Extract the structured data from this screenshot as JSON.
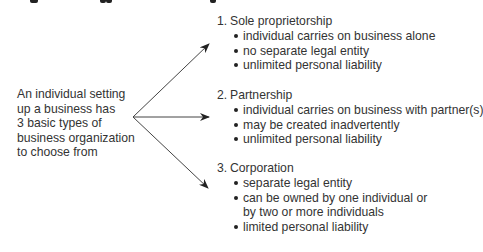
{
  "intro": {
    "lines": [
      "An individual setting",
      "up a business has",
      "3 basic types of",
      "business organization",
      "to choose from"
    ]
  },
  "arrows": {
    "color": "#333333",
    "origin": [
      133,
      117
    ],
    "tips": [
      [
        209,
        44
      ],
      [
        209,
        117
      ],
      [
        208,
        188
      ]
    ]
  },
  "groups": [
    {
      "number": "1.",
      "title": "Sole proprietorship",
      "bullets": [
        "individual carries on business alone",
        "no separate legal entity",
        "unlimited personal liability"
      ]
    },
    {
      "number": "2.",
      "title": "Partnership",
      "bullets": [
        "individual carries on business with partner(s)",
        "may be created inadvertently",
        "unlimited personal liability"
      ]
    },
    {
      "number": "3.",
      "title": "Corporation",
      "bullets": [
        "separate legal entity",
        "can be owned by one individual or by two or more individuals",
        "limited personal liability"
      ]
    }
  ]
}
